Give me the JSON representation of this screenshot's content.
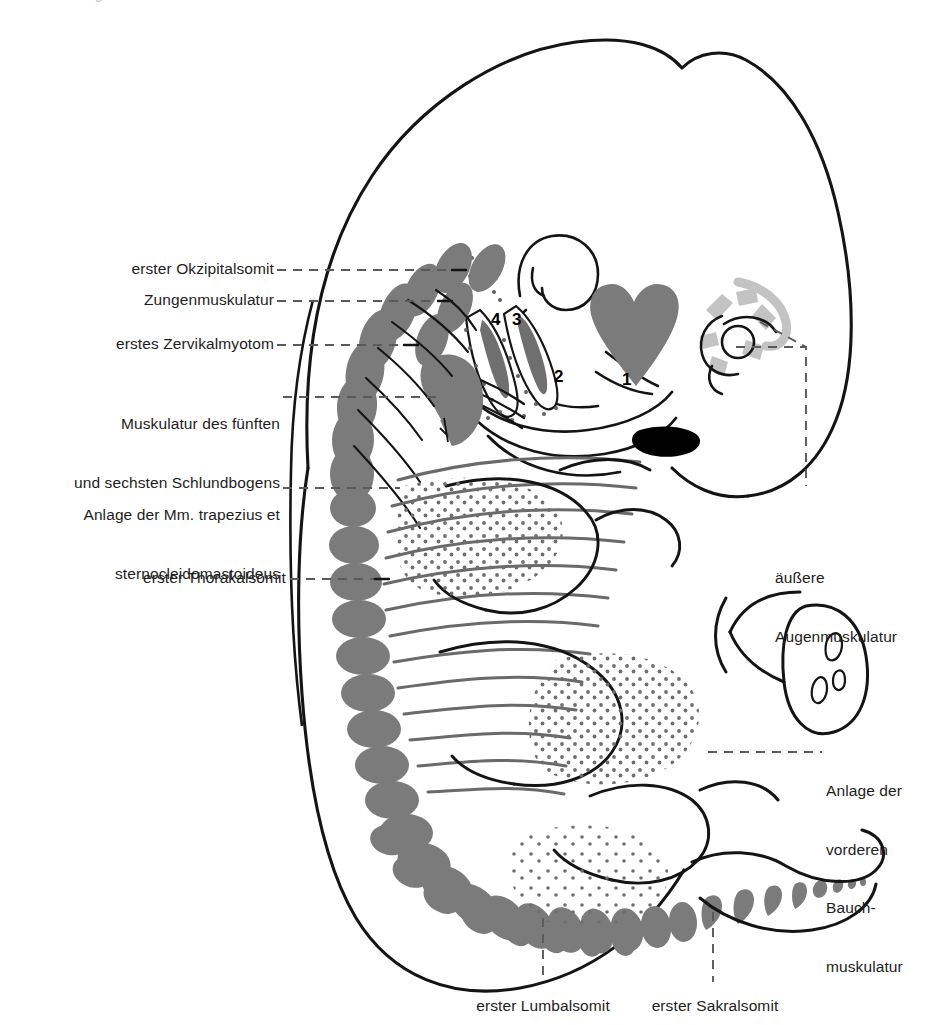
{
  "figure": {
    "language": "de",
    "colors": {
      "somite_gray": "#7b7b7b",
      "outline_black": "#141414",
      "stipple_gray": "#6e6e6e",
      "eye_muscle_gray": "#c3c3c3",
      "solid_black": "#000000",
      "background": "#ffffff"
    },
    "top_crop_artifact": "J"
  },
  "labels_left": [
    {
      "id": "erster-okzipitalsomit",
      "text": "erster Okzipitalsomit",
      "lines": [
        "erster Okzipitalsomit"
      ]
    },
    {
      "id": "zungenmuskulatur",
      "text": "Zungenmuskulatur",
      "lines": [
        "Zungenmuskulatur"
      ]
    },
    {
      "id": "erstes-zervikalmyotom",
      "text": "erstes Zervikalmyotom",
      "lines": [
        "erstes Zervikalmyotom"
      ]
    },
    {
      "id": "schlundbogen-muskulatur",
      "text": "Muskulatur des fünften und sechsten Schlundbogens",
      "lines": [
        "Muskulatur des fünften",
        "und sechsten Schlundbogens"
      ]
    },
    {
      "id": "trapezius-sternocleidomastoideus",
      "text": "Anlage der Mm. trapezius et sternocleidomastoideus",
      "lines": [
        "Anlage der Mm. trapezius et",
        "sternocleidomastoideus"
      ]
    },
    {
      "id": "erster-thorakalsomit",
      "text": "erster Thorakalsomit",
      "lines": [
        "erster Thorakalsomit"
      ]
    }
  ],
  "labels_right": [
    {
      "id": "aeussere-augenmuskulatur",
      "text": "äußere Augenmuskulatur",
      "lines": [
        "äußere",
        "Augenmuskulatur"
      ]
    },
    {
      "id": "vordere-bauchmuskulatur",
      "text": "Anlage der vorderen Bauchmuskulatur",
      "lines": [
        "Anlage der",
        "vorderen",
        "Bauch-",
        "muskulatur"
      ]
    }
  ],
  "labels_bottom": [
    {
      "id": "erster-lumbalsomit",
      "text": "erster Lumbalsomit"
    },
    {
      "id": "erster-sakralsomit",
      "text": "erster Sakralsomit"
    }
  ],
  "pharyngeal_arch_numbers": [
    {
      "id": "arch-4",
      "text": "4",
      "x": 497,
      "y": 324
    },
    {
      "id": "arch-3",
      "text": "3",
      "x": 517,
      "y": 324
    },
    {
      "id": "arch-2",
      "text": "2",
      "x": 560,
      "y": 381
    },
    {
      "id": "arch-1",
      "text": "1",
      "x": 627,
      "y": 384
    }
  ]
}
